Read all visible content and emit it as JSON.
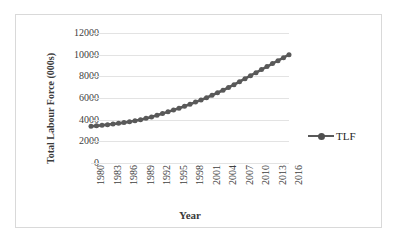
{
  "chart_data": {
    "type": "line",
    "title": "",
    "xlabel": "Year",
    "ylabel": "Total Labour Force (000s)",
    "ylim": [
      0,
      12000
    ],
    "xlim": [
      1980,
      2016
    ],
    "grid": "horizontal",
    "legend_position": "right",
    "series_color": "#595959",
    "marker": "circle",
    "y_ticks": [
      "0",
      "2000",
      "4000",
      "6000",
      "8000",
      "10000",
      "12000"
    ],
    "y_tick_values": [
      0,
      2000,
      4000,
      6000,
      8000,
      10000,
      12000
    ],
    "x_tick_labels": [
      "1980",
      "1983",
      "1986",
      "1989",
      "1992",
      "1995",
      "1998",
      "2001",
      "2004",
      "2007",
      "2010",
      "2013",
      "2016"
    ],
    "x_tick_values": [
      1980,
      1983,
      1986,
      1989,
      1992,
      1995,
      1998,
      2001,
      2004,
      2007,
      2010,
      2013,
      2016
    ],
    "legend": [
      "TLF"
    ],
    "series": [
      {
        "name": "TLF",
        "x": [
          1980,
          1981,
          1982,
          1983,
          1984,
          1985,
          1986,
          1987,
          1988,
          1989,
          1990,
          1991,
          1992,
          1993,
          1994,
          1995,
          1996,
          1997,
          1998,
          1999,
          2000,
          2001,
          2002,
          2003,
          2004,
          2005,
          2006,
          2007,
          2008,
          2009,
          2010,
          2011,
          2012,
          2013,
          2014,
          2015,
          2016
        ],
        "values": [
          3390,
          3430,
          3480,
          3540,
          3600,
          3660,
          3730,
          3810,
          3900,
          4000,
          4120,
          4250,
          4400,
          4560,
          4720,
          4890,
          5060,
          5240,
          5430,
          5620,
          5820,
          6030,
          6250,
          6480,
          6720,
          6970,
          7230,
          7500,
          7780,
          8060,
          8340,
          8620,
          8900,
          9180,
          9450,
          9720,
          10000
        ]
      }
    ]
  },
  "legend_entries": [
    {
      "label": "TLF"
    }
  ]
}
